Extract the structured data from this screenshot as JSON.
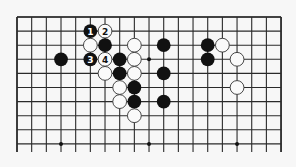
{
  "diagram": {
    "type": "go-board-partial",
    "background": "#f7f7f7",
    "grid": {
      "columns": 19,
      "rows_visible": 10,
      "x0": 17,
      "y0": 17,
      "dx": 14.67,
      "dy": 14.1,
      "open_bottom_extension": 8,
      "line_color": "#2a2a2a"
    },
    "star_points": [
      {
        "col": 9,
        "row": 3
      },
      {
        "col": 3,
        "row": 9
      },
      {
        "col": 9,
        "row": 9
      },
      {
        "col": 15,
        "row": 9
      }
    ],
    "stones": [
      {
        "col": 5,
        "row": 1,
        "color": "black",
        "label": "1"
      },
      {
        "col": 6,
        "row": 1,
        "color": "white",
        "label": "2"
      },
      {
        "col": 5,
        "row": 2,
        "color": "white",
        "label": ""
      },
      {
        "col": 6,
        "row": 2,
        "color": "black",
        "label": ""
      },
      {
        "col": 8,
        "row": 2,
        "color": "white",
        "label": ""
      },
      {
        "col": 10,
        "row": 2,
        "color": "black",
        "label": ""
      },
      {
        "col": 13,
        "row": 2,
        "color": "black",
        "label": ""
      },
      {
        "col": 14,
        "row": 2,
        "color": "white",
        "label": ""
      },
      {
        "col": 3,
        "row": 3,
        "color": "black",
        "label": ""
      },
      {
        "col": 5,
        "row": 3,
        "color": "black",
        "label": "3"
      },
      {
        "col": 6,
        "row": 3,
        "color": "white",
        "label": "4"
      },
      {
        "col": 7,
        "row": 3,
        "color": "black",
        "label": ""
      },
      {
        "col": 8,
        "row": 3,
        "color": "white",
        "label": ""
      },
      {
        "col": 13,
        "row": 3,
        "color": "black",
        "label": ""
      },
      {
        "col": 15,
        "row": 3,
        "color": "white",
        "label": ""
      },
      {
        "col": 6,
        "row": 4,
        "color": "white",
        "label": ""
      },
      {
        "col": 7,
        "row": 4,
        "color": "black",
        "label": ""
      },
      {
        "col": 8,
        "row": 4,
        "color": "white",
        "label": ""
      },
      {
        "col": 10,
        "row": 4,
        "color": "black",
        "label": ""
      },
      {
        "col": 7,
        "row": 5,
        "color": "white",
        "label": ""
      },
      {
        "col": 8,
        "row": 5,
        "color": "black",
        "label": ""
      },
      {
        "col": 15,
        "row": 5,
        "color": "white",
        "label": ""
      },
      {
        "col": 7,
        "row": 6,
        "color": "white",
        "label": ""
      },
      {
        "col": 8,
        "row": 6,
        "color": "black",
        "label": ""
      },
      {
        "col": 10,
        "row": 6,
        "color": "black",
        "label": ""
      },
      {
        "col": 8,
        "row": 7,
        "color": "white",
        "label": ""
      }
    ],
    "move_labels": [
      "1",
      "2",
      "3",
      "4"
    ]
  }
}
